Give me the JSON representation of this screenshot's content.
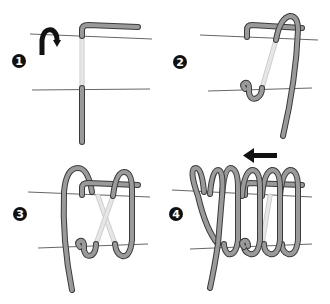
{
  "diagram": {
    "steps": [
      {
        "number": "1",
        "label": "1",
        "note": "Bend end over top line, run down past bottom line; curved arrow indicates direction of wrap"
      },
      {
        "number": "2",
        "label": "2",
        "note": "Bring cord up from bottom and over the top line, forming first loop"
      },
      {
        "number": "3",
        "label": "3",
        "note": "Second loop wrapped, strands crossing behind"
      },
      {
        "number": "4",
        "label": "4",
        "note": "Continue wrapping loops; arrow points left indicating wrapping direction"
      }
    ],
    "arrows": [
      {
        "step": "1",
        "type": "curved-arrow-down",
        "color": "#111111"
      },
      {
        "step": "4",
        "type": "arrow-left",
        "color": "#111111"
      }
    ],
    "colors": {
      "wire_outline": "#3a3a3a",
      "wire_fill": "#9a9a9a",
      "hidden_wire": "#e6e6e6",
      "guide_lines": "#555555",
      "badge": "#111111",
      "background": "#ffffff"
    }
  }
}
